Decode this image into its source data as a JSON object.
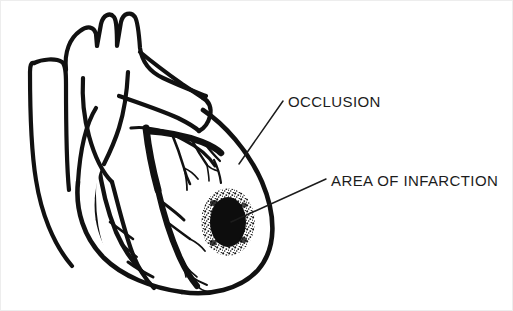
{
  "figure": {
    "background_color": "#ffffff",
    "ink_color": "#111111",
    "text_color": "#1c1c1c",
    "frame_color": "#ededed",
    "width": 513,
    "height": 311
  },
  "labels": [
    {
      "id": "occlusion",
      "text": "OCCLUSION",
      "x": 288,
      "y": 107,
      "leader_from": [
        283,
        101
      ],
      "leader_to": [
        239,
        164
      ]
    },
    {
      "id": "area-of-infarction",
      "text": "AREA OF INFARCTION",
      "x": 331,
      "y": 186,
      "leader_from": [
        326,
        179
      ],
      "leader_to": [
        231,
        222
      ]
    }
  ],
  "anatomy": {
    "heart_outline_label": "heart-outline",
    "aorta_label": "aorta",
    "great_vessels_label": "great-vessels",
    "pulmonary_artery_label": "pulmonary-artery",
    "left_coronary_label": "left-coronary-artery",
    "right_coronary_label": "right-coronary-artery",
    "infarct_label": "infarction-zone",
    "infarct_center": [
      228,
      222
    ],
    "infarct_core_rx": 18,
    "infarct_core_ry": 25,
    "infarct_halo_rx": 26,
    "infarct_halo_ry": 33
  }
}
